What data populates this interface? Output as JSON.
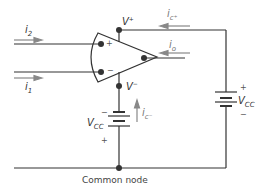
{
  "diagram": {
    "type": "op-amp terminal currents circuit",
    "labels": {
      "i2": "i",
      "i2_sub": "2",
      "i1": "i",
      "i1_sub": "1",
      "vplus": "V",
      "vplus_sup": "+",
      "vminus": "V",
      "vminus_sup": "−",
      "ic_plus": "i",
      "ic_plus_sub": "c⁺",
      "io": "i",
      "io_sub": "o",
      "ic_minus": "i",
      "ic_minus_sub": "c⁻",
      "vcc_right": "V",
      "vcc_right_sub": "CC",
      "vcc_left": "V",
      "vcc_left_sub": "CC",
      "noninv_sign": "+",
      "inv_sign": "−",
      "batt_right_plus": "+",
      "batt_right_minus": "−",
      "batt_left_minus": "−",
      "batt_left_plus": "+"
    },
    "caption": "Common node",
    "colors": {
      "wire": "#333333",
      "arrow": "#888888",
      "text": "#333333"
    }
  }
}
